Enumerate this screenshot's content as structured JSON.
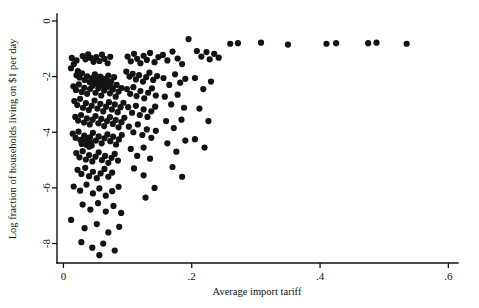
{
  "figure": {
    "background": "#ffffff",
    "point_color": "#131313",
    "axis_color": "#111111"
  },
  "chart_data": {
    "type": "scatter",
    "title": "",
    "xlabel": "Average import tariff",
    "ylabel": "Log fraction of households living on $1 per day",
    "xlim": [
      -0.01,
      0.615
    ],
    "ylim": [
      -8.7,
      0.25
    ],
    "xticks": [
      0,
      0.2,
      0.4,
      0.6
    ],
    "xticklabels": [
      "0",
      ".2",
      ".4",
      ".6"
    ],
    "yticks": [
      0,
      -2,
      -4,
      -6,
      -8
    ],
    "yticklabels": [
      "0",
      "-2",
      "-4",
      "-6",
      "-8"
    ],
    "grid": false,
    "legend": null,
    "marker": "circle",
    "marker_size": 3.1,
    "n_points": 248,
    "points": [
      [
        0.013,
        -1.33
      ],
      [
        0.0162,
        -1.55
      ],
      [
        0.0205,
        -1.42
      ],
      [
        0.0118,
        -1.7
      ],
      [
        0.0225,
        -1.8
      ],
      [
        0.03,
        -1.26
      ],
      [
        0.0345,
        -1.38
      ],
      [
        0.0385,
        -1.2
      ],
      [
        0.0425,
        -1.33
      ],
      [
        0.047,
        -1.47
      ],
      [
        0.051,
        -1.3
      ],
      [
        0.056,
        -1.44
      ],
      [
        0.06,
        -1.21
      ],
      [
        0.064,
        -1.36
      ],
      [
        0.069,
        -1.52
      ],
      [
        0.073,
        -1.29
      ],
      [
        0.0205,
        -1.95
      ],
      [
        0.025,
        -2.03
      ],
      [
        0.029,
        -1.88
      ],
      [
        0.033,
        -2.12
      ],
      [
        0.037,
        -1.99
      ],
      [
        0.041,
        -2.2
      ],
      [
        0.045,
        -2.05
      ],
      [
        0.049,
        -1.92
      ],
      [
        0.053,
        -2.15
      ],
      [
        0.0575,
        -2.0
      ],
      [
        0.0615,
        -2.25
      ],
      [
        0.0655,
        -2.08
      ],
      [
        0.07,
        -1.96
      ],
      [
        0.0745,
        -2.18
      ],
      [
        0.079,
        -2.02
      ],
      [
        0.083,
        -2.3
      ],
      [
        0.0155,
        -2.35
      ],
      [
        0.0195,
        -2.48
      ],
      [
        0.024,
        -2.28
      ],
      [
        0.0285,
        -2.55
      ],
      [
        0.0325,
        -2.4
      ],
      [
        0.037,
        -2.62
      ],
      [
        0.0415,
        -2.45
      ],
      [
        0.0455,
        -2.33
      ],
      [
        0.05,
        -2.58
      ],
      [
        0.0545,
        -2.42
      ],
      [
        0.059,
        -2.68
      ],
      [
        0.0635,
        -2.5
      ],
      [
        0.068,
        -2.37
      ],
      [
        0.0725,
        -2.6
      ],
      [
        0.077,
        -2.46
      ],
      [
        0.0815,
        -2.72
      ],
      [
        0.086,
        -2.54
      ],
      [
        0.0905,
        -2.41
      ],
      [
        0.056,
        -2.1
      ],
      [
        0.058,
        -2.18
      ],
      [
        0.0605,
        -2.06
      ],
      [
        0.0625,
        -2.22
      ],
      [
        0.0645,
        -2.14
      ],
      [
        0.0665,
        -2.26
      ],
      [
        0.053,
        -2.16
      ],
      [
        0.055,
        -2.28
      ],
      [
        0.0595,
        -2.32
      ],
      [
        0.0615,
        -2.12
      ],
      [
        0.064,
        -2.34
      ],
      [
        0.066,
        -2.2
      ],
      [
        0.05,
        -2.24
      ],
      [
        0.052,
        -2.08
      ],
      [
        0.068,
        -2.3
      ],
      [
        0.07,
        -2.16
      ],
      [
        0.048,
        -2.12
      ],
      [
        0.046,
        -2.26
      ],
      [
        0.072,
        -2.22
      ],
      [
        0.074,
        -2.36
      ],
      [
        0.017,
        -2.88
      ],
      [
        0.0215,
        -3.02
      ],
      [
        0.026,
        -2.8
      ],
      [
        0.0305,
        -3.12
      ],
      [
        0.035,
        -2.95
      ],
      [
        0.0395,
        -3.2
      ],
      [
        0.044,
        -3.05
      ],
      [
        0.0485,
        -2.86
      ],
      [
        0.053,
        -3.15
      ],
      [
        0.0575,
        -2.98
      ],
      [
        0.062,
        -3.25
      ],
      [
        0.0665,
        -3.08
      ],
      [
        0.071,
        -2.92
      ],
      [
        0.0755,
        -3.18
      ],
      [
        0.08,
        -3.0
      ],
      [
        0.0845,
        -3.28
      ],
      [
        0.089,
        -3.1
      ],
      [
        0.0935,
        -2.94
      ],
      [
        0.0185,
        -3.45
      ],
      [
        0.023,
        -3.58
      ],
      [
        0.0275,
        -3.38
      ],
      [
        0.032,
        -3.65
      ],
      [
        0.0365,
        -3.5
      ],
      [
        0.041,
        -3.72
      ],
      [
        0.0455,
        -3.55
      ],
      [
        0.05,
        -3.42
      ],
      [
        0.0545,
        -3.68
      ],
      [
        0.059,
        -3.52
      ],
      [
        0.0635,
        -3.78
      ],
      [
        0.068,
        -3.6
      ],
      [
        0.0725,
        -3.46
      ],
      [
        0.077,
        -3.7
      ],
      [
        0.0815,
        -3.56
      ],
      [
        0.086,
        -3.82
      ],
      [
        0.0905,
        -3.64
      ],
      [
        0.095,
        -3.48
      ],
      [
        0.0145,
        -4.05
      ],
      [
        0.019,
        -4.2
      ],
      [
        0.0235,
        -3.98
      ],
      [
        0.028,
        -4.28
      ],
      [
        0.0325,
        -4.12
      ],
      [
        0.037,
        -4.35
      ],
      [
        0.0415,
        -4.18
      ],
      [
        0.046,
        -4.02
      ],
      [
        0.0505,
        -4.3
      ],
      [
        0.055,
        -4.15
      ],
      [
        0.0595,
        -4.4
      ],
      [
        0.064,
        -4.22
      ],
      [
        0.0685,
        -4.08
      ],
      [
        0.073,
        -4.32
      ],
      [
        0.0775,
        -4.16
      ],
      [
        0.082,
        -4.44
      ],
      [
        0.0865,
        -4.26
      ],
      [
        0.091,
        -4.1
      ],
      [
        0.03,
        -4.25
      ],
      [
        0.032,
        -4.38
      ],
      [
        0.034,
        -4.18
      ],
      [
        0.036,
        -4.45
      ],
      [
        0.038,
        -4.3
      ],
      [
        0.04,
        -4.52
      ],
      [
        0.0285,
        -4.42
      ],
      [
        0.0265,
        -4.28
      ],
      [
        0.042,
        -4.35
      ],
      [
        0.044,
        -4.48
      ],
      [
        0.02,
        -4.75
      ],
      [
        0.025,
        -4.9
      ],
      [
        0.03,
        -4.68
      ],
      [
        0.035,
        -4.98
      ],
      [
        0.04,
        -4.82
      ],
      [
        0.045,
        -5.05
      ],
      [
        0.05,
        -4.88
      ],
      [
        0.055,
        -4.72
      ],
      [
        0.06,
        -5.0
      ],
      [
        0.065,
        -4.85
      ],
      [
        0.07,
        -5.1
      ],
      [
        0.075,
        -4.92
      ],
      [
        0.08,
        -4.78
      ],
      [
        0.085,
        -5.02
      ],
      [
        0.022,
        -5.35
      ],
      [
        0.028,
        -5.5
      ],
      [
        0.034,
        -5.28
      ],
      [
        0.04,
        -5.58
      ],
      [
        0.046,
        -5.42
      ],
      [
        0.052,
        -5.65
      ],
      [
        0.058,
        -5.48
      ],
      [
        0.064,
        -5.32
      ],
      [
        0.07,
        -5.6
      ],
      [
        0.076,
        -5.45
      ],
      [
        0.016,
        -5.95
      ],
      [
        0.026,
        -6.1
      ],
      [
        0.036,
        -5.88
      ],
      [
        0.046,
        -6.2
      ],
      [
        0.056,
        -6.02
      ],
      [
        0.066,
        -6.28
      ],
      [
        0.076,
        -6.12
      ],
      [
        0.086,
        -5.96
      ],
      [
        0.03,
        -6.6
      ],
      [
        0.042,
        -6.78
      ],
      [
        0.054,
        -6.55
      ],
      [
        0.066,
        -6.85
      ],
      [
        0.078,
        -6.65
      ],
      [
        0.09,
        -6.9
      ],
      [
        0.012,
        -7.15
      ],
      [
        0.033,
        -7.45
      ],
      [
        0.052,
        -7.3
      ],
      [
        0.07,
        -7.6
      ],
      [
        0.087,
        -7.4
      ],
      [
        0.028,
        -7.95
      ],
      [
        0.045,
        -8.15
      ],
      [
        0.062,
        -8.0
      ],
      [
        0.08,
        -8.25
      ],
      [
        0.056,
        -8.42
      ],
      [
        0.1,
        -1.28
      ],
      [
        0.105,
        -1.45
      ],
      [
        0.11,
        -1.18
      ],
      [
        0.115,
        -1.36
      ],
      [
        0.12,
        -1.52
      ],
      [
        0.125,
        -1.25
      ],
      [
        0.13,
        -1.4
      ],
      [
        0.135,
        -1.15
      ],
      [
        0.142,
        -1.48
      ],
      [
        0.148,
        -1.3
      ],
      [
        0.098,
        -1.82
      ],
      [
        0.103,
        -2.0
      ],
      [
        0.108,
        -1.9
      ],
      [
        0.113,
        -2.1
      ],
      [
        0.118,
        -1.95
      ],
      [
        0.124,
        -2.18
      ],
      [
        0.129,
        -2.02
      ],
      [
        0.134,
        -1.86
      ],
      [
        0.14,
        -2.12
      ],
      [
        0.146,
        -1.98
      ],
      [
        0.099,
        -2.45
      ],
      [
        0.104,
        -2.62
      ],
      [
        0.109,
        -2.38
      ],
      [
        0.114,
        -2.7
      ],
      [
        0.12,
        -2.52
      ],
      [
        0.126,
        -2.78
      ],
      [
        0.132,
        -2.58
      ],
      [
        0.138,
        -2.42
      ],
      [
        0.144,
        -2.68
      ],
      [
        0.101,
        -3.1
      ],
      [
        0.107,
        -3.3
      ],
      [
        0.113,
        -3.05
      ],
      [
        0.119,
        -3.38
      ],
      [
        0.125,
        -3.18
      ],
      [
        0.131,
        -3.45
      ],
      [
        0.137,
        -3.25
      ],
      [
        0.143,
        -3.08
      ],
      [
        0.102,
        -3.8
      ],
      [
        0.109,
        -4.0
      ],
      [
        0.116,
        -3.72
      ],
      [
        0.123,
        -4.1
      ],
      [
        0.13,
        -3.9
      ],
      [
        0.137,
        -4.2
      ],
      [
        0.144,
        -3.95
      ],
      [
        0.105,
        -4.6
      ],
      [
        0.115,
        -4.85
      ],
      [
        0.125,
        -4.55
      ],
      [
        0.135,
        -4.95
      ],
      [
        0.11,
        -5.3
      ],
      [
        0.125,
        -5.55
      ],
      [
        0.142,
        -6.0
      ],
      [
        0.128,
        -6.35
      ],
      [
        0.155,
        -1.22
      ],
      [
        0.162,
        -1.42
      ],
      [
        0.17,
        -1.1
      ],
      [
        0.178,
        -1.35
      ],
      [
        0.185,
        -1.55
      ],
      [
        0.156,
        -2.05
      ],
      [
        0.165,
        -2.3
      ],
      [
        0.174,
        -1.92
      ],
      [
        0.182,
        -2.22
      ],
      [
        0.19,
        -2.08
      ],
      [
        0.158,
        -2.72
      ],
      [
        0.168,
        -3.0
      ],
      [
        0.178,
        -2.65
      ],
      [
        0.188,
        -3.12
      ],
      [
        0.16,
        -3.6
      ],
      [
        0.172,
        -3.85
      ],
      [
        0.184,
        -3.55
      ],
      [
        0.162,
        -4.4
      ],
      [
        0.176,
        -4.7
      ],
      [
        0.19,
        -4.3
      ],
      [
        0.17,
        -5.25
      ],
      [
        0.185,
        -5.6
      ],
      [
        0.195,
        -0.65
      ],
      [
        0.208,
        -1.08
      ],
      [
        0.215,
        -1.28
      ],
      [
        0.223,
        -1.12
      ],
      [
        0.228,
        -1.38
      ],
      [
        0.235,
        -1.18
      ],
      [
        0.242,
        -1.32
      ],
      [
        0.205,
        -2.05
      ],
      [
        0.218,
        -2.45
      ],
      [
        0.23,
        -2.18
      ],
      [
        0.212,
        -3.15
      ],
      [
        0.226,
        -3.6
      ],
      [
        0.205,
        -4.25
      ],
      [
        0.22,
        -4.55
      ],
      [
        0.26,
        -0.82
      ],
      [
        0.272,
        -0.8
      ],
      [
        0.308,
        -0.78
      ],
      [
        0.35,
        -0.85
      ],
      [
        0.41,
        -0.82
      ],
      [
        0.425,
        -0.8
      ],
      [
        0.475,
        -0.8
      ],
      [
        0.488,
        -0.78
      ],
      [
        0.535,
        -0.82
      ]
    ]
  }
}
